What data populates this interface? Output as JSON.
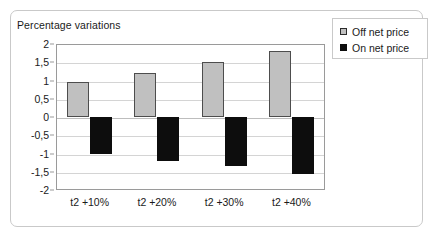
{
  "figure": {
    "title": "Percentage variations"
  },
  "legend": {
    "position": "right",
    "entries": [
      {
        "label": "Off net price",
        "swatch": "gray-square-swatch",
        "color": "#C0C0C0"
      },
      {
        "label": "On net price",
        "swatch": "black-square-swatch",
        "color": "#0D0D0D"
      }
    ]
  },
  "chart_data": {
    "type": "bar",
    "title": "Percentage variations",
    "xlabel": "",
    "ylabel": "",
    "categories": [
      "t2 +10%",
      "t2 +20%",
      "t2 +30%",
      "t2 +40%"
    ],
    "series": [
      {
        "name": "Off net price",
        "color": "#C0C0C0",
        "values": [
          0.95,
          1.2,
          1.5,
          1.8
        ]
      },
      {
        "name": "On net price",
        "color": "#0D0D0D",
        "values": [
          -1.0,
          -1.2,
          -1.35,
          -1.55
        ]
      }
    ],
    "ylim": [
      -2,
      2
    ],
    "ytick_step": 0.5,
    "ytick_labels": [
      "2",
      "1,5",
      "1",
      "0,5",
      "0",
      "-0,5",
      "-1",
      "-1,5",
      "-2"
    ],
    "ytick_values": [
      2,
      1.5,
      1,
      0.5,
      0,
      -0.5,
      -1,
      -1.5,
      -2
    ],
    "grid": true,
    "grid_axis": "y",
    "legend_position": "right",
    "decimal_separator": ","
  }
}
